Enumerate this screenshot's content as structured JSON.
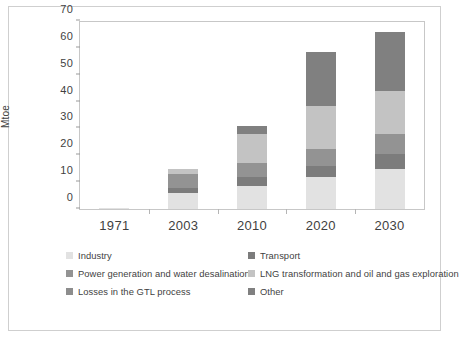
{
  "figure": {
    "title_partial": "",
    "border_color": "#cfcfcf",
    "background": "#ffffff"
  },
  "axis": {
    "ylabel": "Mtoe",
    "yticks": [
      "0",
      "10",
      "20",
      "30",
      "40",
      "50",
      "60",
      "70"
    ],
    "xticks": [
      "1971",
      "2003",
      "2010",
      "2020",
      "2030"
    ]
  },
  "legend": {
    "rows": [
      {
        "left": {
          "label": "Industry",
          "color": "#e2e2e2",
          "swatch_name": "legend-swatch-industry"
        },
        "right": {
          "label": "Transport",
          "color": "#7c7c7c",
          "swatch_name": "legend-swatch-transport"
        }
      },
      {
        "left": {
          "label": "Power generation and water desalination",
          "color": "#939393",
          "swatch_name": "legend-swatch-power-generation"
        },
        "right": {
          "label": "LNG transformation and oil and gas exploration",
          "color": "#c3c3c3",
          "swatch_name": "legend-swatch-lng-transformation"
        }
      },
      {
        "left": {
          "label": "Losses in the GTL process",
          "color": "#8d8d8d",
          "swatch_name": "legend-swatch-gtl-losses"
        },
        "right": {
          "label": "Other",
          "color": "#808080",
          "swatch_name": "legend-swatch-other"
        }
      }
    ]
  },
  "chart_data": {
    "type": "bar",
    "stacked": true,
    "title": "",
    "xlabel": "",
    "ylabel": "Mtoe",
    "ylim": [
      0,
      70
    ],
    "ytick_step": 10,
    "grid": false,
    "legend_position": "bottom",
    "categories": [
      "1971",
      "2003",
      "2010",
      "2020",
      "2030"
    ],
    "series": [
      {
        "name": "Industry",
        "color": "#e2e2e2",
        "values": [
          0.5,
          6.0,
          8.5,
          12.0,
          15.0
        ]
      },
      {
        "name": "Transport",
        "color": "#7c7c7c",
        "values": [
          0.0,
          1.8,
          3.5,
          4.0,
          5.5
        ]
      },
      {
        "name": "Power generation and water desalination",
        "color": "#939393",
        "values": [
          0.0,
          5.2,
          5.0,
          6.5,
          7.5
        ]
      },
      {
        "name": "LNG transformation and oil and gas exploration",
        "color": "#c3c3c3",
        "values": [
          0.0,
          2.0,
          11.0,
          16.0,
          16.0
        ]
      },
      {
        "name": "Losses in the GTL process",
        "color": "#8d8d8d",
        "values": [
          0.0,
          0.0,
          0.0,
          0.0,
          0.0
        ]
      },
      {
        "name": "Other",
        "color": "#808080",
        "values": [
          0.0,
          0.0,
          3.0,
          20.0,
          22.0
        ]
      }
    ],
    "totals": [
      0.5,
      15.0,
      31.0,
      58.5,
      66.0
    ]
  }
}
